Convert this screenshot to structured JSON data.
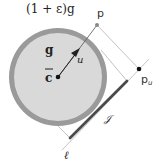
{
  "diagram": {
    "labels": {
      "outer_circle": "(1 + ε)g",
      "inner_circle": "g",
      "center": "c",
      "direction": "u",
      "point_p": "p",
      "point_pu_base": "p",
      "point_pu_sub": "u",
      "segment": "𝒥",
      "line": "ℓ"
    },
    "colors": {
      "outer_ring": "#9a9a9a",
      "inner_disk": "#d9d9d9",
      "segment": "#4a4a4a",
      "thin_lines": "#bdbdbd",
      "points": "#111111"
    },
    "geometry": {
      "center": [
        58,
        77
      ],
      "outer_radius": 49,
      "inner_radius": 44,
      "p": [
        97,
        25
      ],
      "p_u": [
        139,
        69
      ],
      "segment_start": [
        127,
        81
      ],
      "segment_end": [
        70,
        138
      ]
    }
  }
}
